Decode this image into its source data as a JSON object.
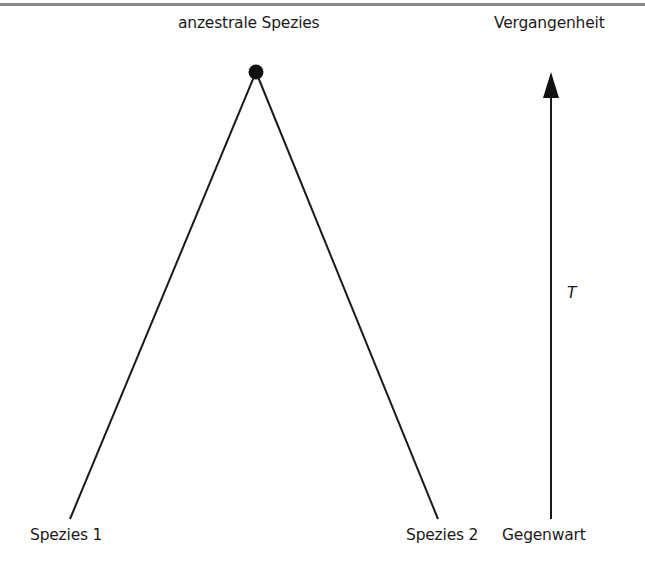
{
  "diagram": {
    "ancestor_label": "anzestrale Spezies",
    "species1_label": "Spezies 1",
    "species2_label": "Spezies 2",
    "past_label": "Vergangenheit",
    "present_label": "Gegenwart",
    "time_label": "T",
    "nodes": [
      {
        "id": "ancestor",
        "x": 256,
        "y": 72
      },
      {
        "id": "species1",
        "x": 70,
        "y": 519
      },
      {
        "id": "species2",
        "x": 438,
        "y": 519
      }
    ],
    "edges": [
      {
        "from": "ancestor",
        "to": "species1"
      },
      {
        "from": "ancestor",
        "to": "species2"
      }
    ],
    "time_axis": {
      "x": 551,
      "y_start": 519,
      "y_end": 72,
      "direction": "up"
    },
    "colors": {
      "line": "#1a1a1a",
      "text": "#1a1a1a",
      "top_rule": "#8a8a8a"
    }
  }
}
